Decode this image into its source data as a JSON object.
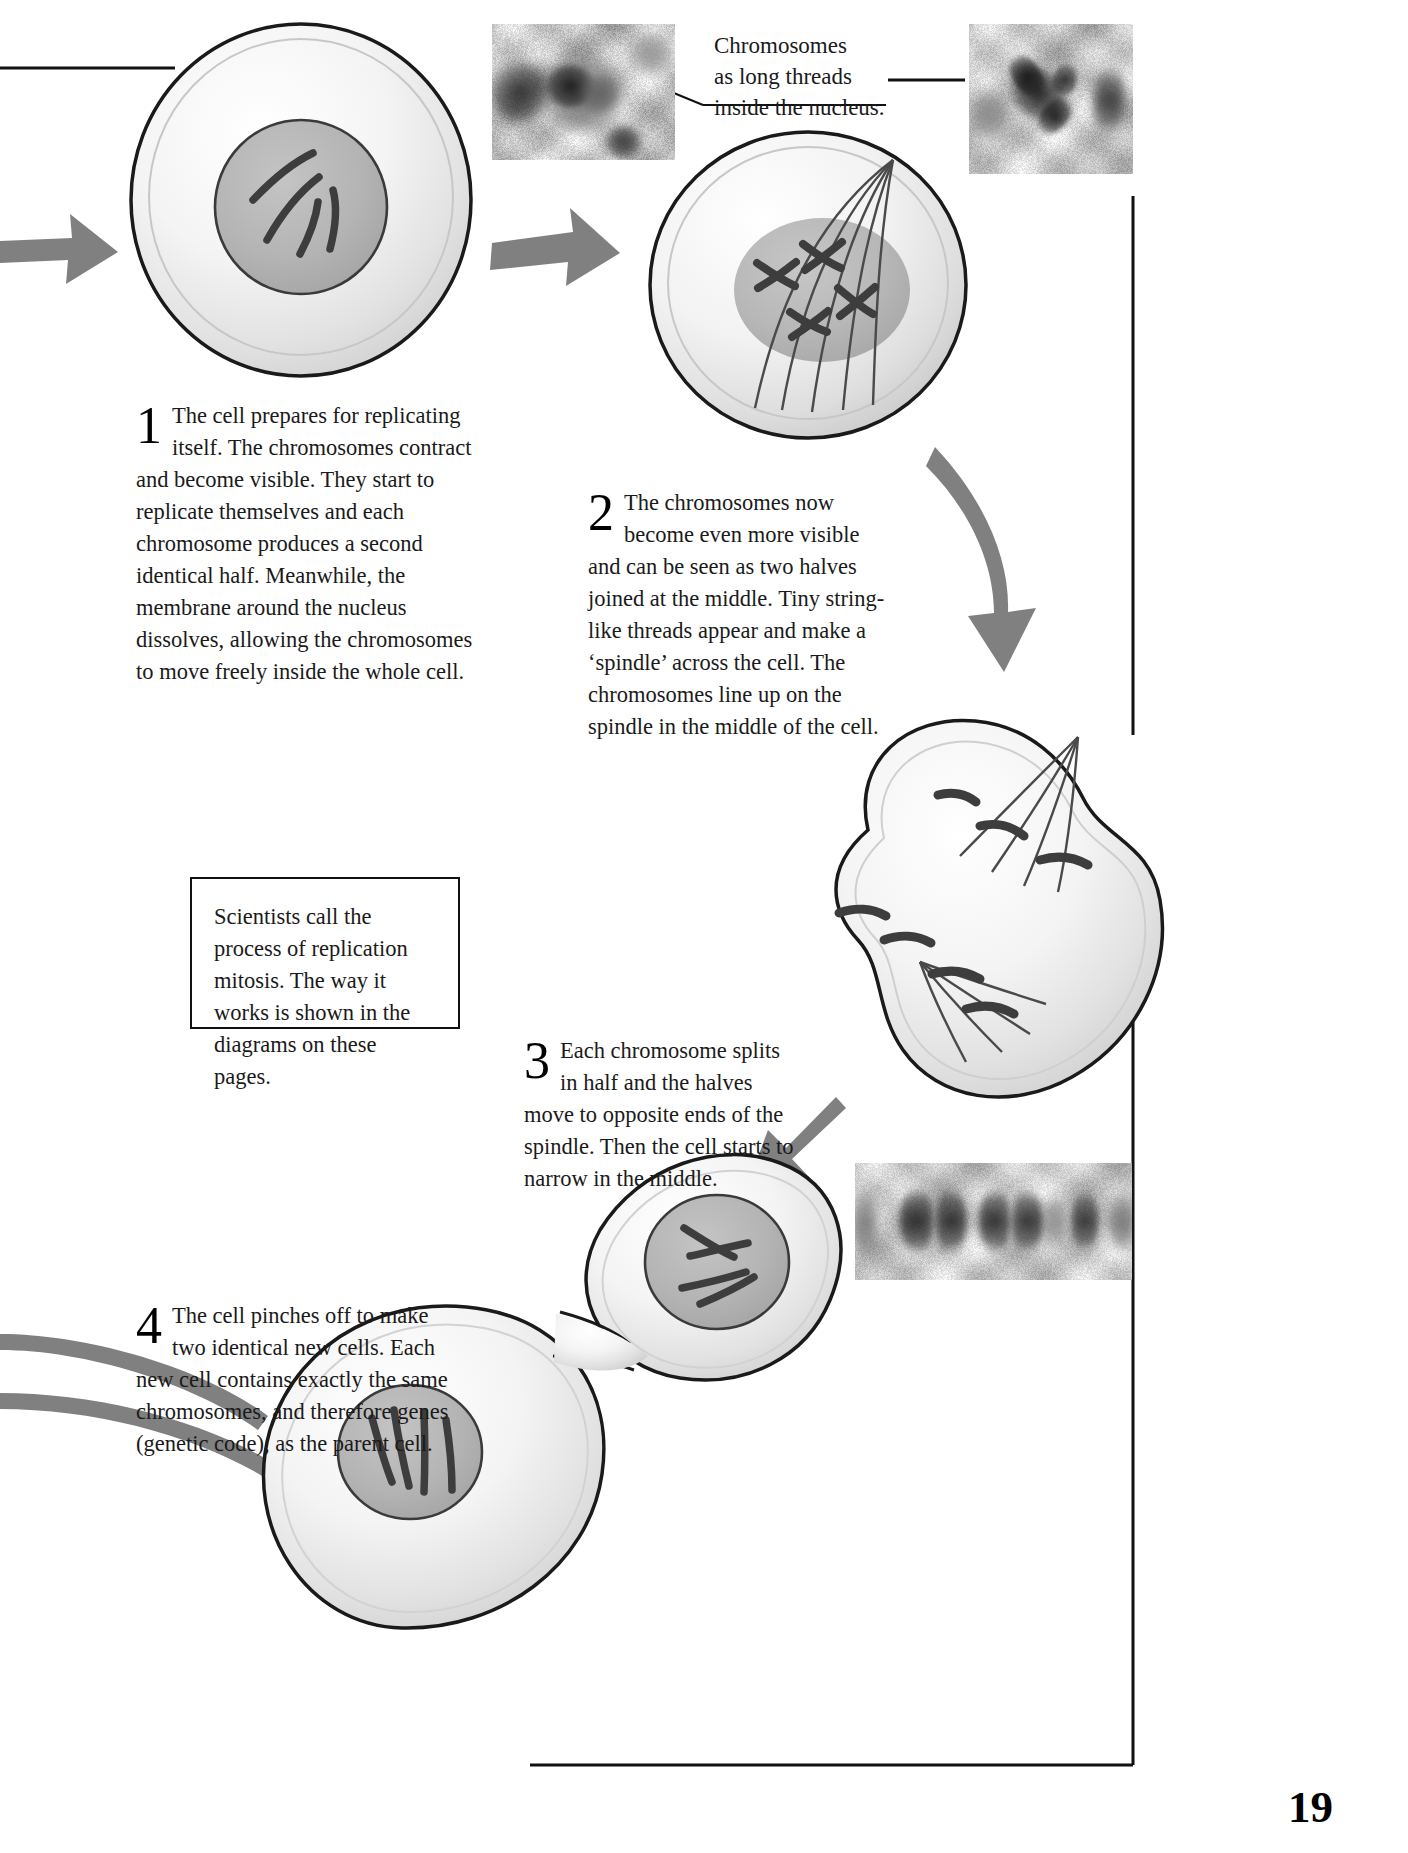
{
  "page": {
    "number": "19"
  },
  "callouts": [
    {
      "name": "chromosome-threads-callout",
      "line1": "Chromosomes",
      "line2": "as long threads",
      "line3": "inside the nucleus."
    }
  ],
  "steps": [
    {
      "number": "1",
      "text": "The cell prepares for replicating itself. The chromosomes contract and become visible. They start to replicate themselves and each chromosome produces a second identical half. Meanwhile, the membrane around the nucleus dissolves, allowing the chromosomes to move freely inside the whole cell."
    },
    {
      "number": "2",
      "text": "The chromosomes now become even more visible and can be seen as two halves joined at the middle. Tiny string-like threads appear and make a ‘spindle’ across the cell. The chromosomes line up on the spindle in the middle of the cell."
    },
    {
      "number": "3",
      "text": "Each chromosome splits in half and the halves move to opposite ends of the spindle. Then the cell starts to narrow in the middle."
    },
    {
      "number": "4",
      "text": "The cell pinches off to make two identical new cells. Each new cell contains exactly the same chromosomes, and therefore genes (genetic code), as the parent cell."
    }
  ],
  "note_box": {
    "name": "mitosis-note",
    "text": "Scientists call the process of replication mitosis. The way it works is shown in the diagrams on these pages."
  },
  "figures": [
    {
      "name": "cell-stage-1",
      "label": "Cell with chromosomes as threads in nucleus"
    },
    {
      "name": "cell-stage-2",
      "label": "Cell with spindle and paired chromosomes"
    },
    {
      "name": "cell-stage-3",
      "label": "Cell narrowing, chromosome halves at opposite ends"
    },
    {
      "name": "cell-stage-4",
      "label": "Two new daughter cells pinching apart"
    }
  ],
  "micrographs": [
    {
      "name": "micrograph-interphase",
      "label": "Nucleus with long chromosome threads"
    },
    {
      "name": "micrograph-prophase",
      "label": "Condensed dark chromosomes"
    },
    {
      "name": "micrograph-telophase",
      "label": "Two separating chromosome masses"
    }
  ],
  "colors": {
    "arrow": "#808080",
    "nucleus": "#b2b2b2",
    "cell_body": "#ededed",
    "cell_outline": "#1a1a1a",
    "chromosome": "#3d3d3d",
    "text": "#1a1a1a",
    "rule": "#111111"
  }
}
